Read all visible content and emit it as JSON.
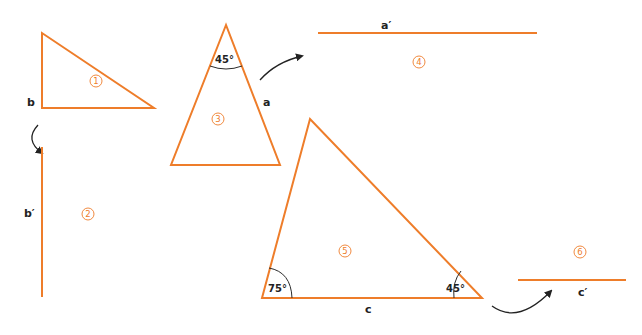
{
  "figure": {
    "colors": {
      "shape": "#ee7d2a",
      "text": "#222222",
      "background": "#ffffff"
    },
    "shapes": [
      {
        "id": "1",
        "type": "triangle",
        "side_label": "b"
      },
      {
        "id": "2",
        "type": "segment",
        "label": "b′"
      },
      {
        "id": "3",
        "type": "triangle",
        "side_label": "a",
        "angle": "45°"
      },
      {
        "id": "4",
        "type": "segment",
        "label": "a′"
      },
      {
        "id": "5",
        "type": "triangle",
        "side_label": "c",
        "angles": [
          "75°",
          "45°"
        ]
      },
      {
        "id": "6",
        "type": "segment",
        "label": "c′"
      }
    ],
    "numbers": [
      "1",
      "2",
      "3",
      "4",
      "5",
      "6"
    ],
    "labels": {
      "b": "b",
      "b_prime": "b′",
      "a": "a",
      "a_prime": "a′",
      "c": "c",
      "c_prime": "c′"
    },
    "angles": {
      "t3_apex": "45°",
      "t5_left": "75°",
      "t5_right": "45°"
    },
    "arrows": [
      {
        "from": "b",
        "to": "b′"
      },
      {
        "from": "a",
        "to": "a′"
      },
      {
        "from": "c",
        "to": "c′"
      }
    ]
  }
}
